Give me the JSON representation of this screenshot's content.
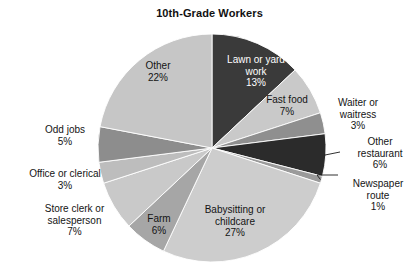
{
  "chart_data": {
    "type": "pie",
    "title": "10th-Grade Workers",
    "xlabel": "",
    "ylabel": "",
    "legend_position": "none",
    "grid": false,
    "units": "percent",
    "start_angle_deg": 0,
    "direction": "clockwise",
    "categories": [
      "Lawn or yard work",
      "Fast food",
      "Waiter or waitress",
      "Other restaurant",
      "Newspaper route",
      "Babysitting or childcare",
      "Farm",
      "Store clerk or salesperson",
      "Office or clerical",
      "Odd jobs",
      "Other"
    ],
    "values": [
      13,
      7,
      3,
      6,
      1,
      27,
      6,
      7,
      3,
      5,
      22
    ],
    "slices": [
      {
        "name": "lawn-or-yard-work",
        "label_line1": "Lawn or yard",
        "label_line2": "work",
        "label_line3": "13%",
        "value": 13,
        "value_text": "13%",
        "color": "#3a3a3a",
        "text_color": "#ffffff",
        "label_placement": "inside",
        "leader_line": false
      },
      {
        "name": "fast-food",
        "label_line1": "Fast food",
        "label_line2": "7%",
        "label_line3": "",
        "value": 7,
        "value_text": "7%",
        "color": "#c9c9c9",
        "text_color": "#141414",
        "label_placement": "inside",
        "leader_line": false
      },
      {
        "name": "waiter-or-waitress",
        "label_line1": "Waiter or",
        "label_line2": "waitress",
        "label_line3": "3%",
        "value": 3,
        "value_text": "3%",
        "color": "#8f8f8f",
        "text_color": "#141414",
        "label_placement": "outside",
        "leader_line": false
      },
      {
        "name": "other-restaurant",
        "label_line1": "Other",
        "label_line2": "restaurant",
        "label_line3": "6%",
        "value": 6,
        "value_text": "6%",
        "color": "#2b2b2b",
        "text_color": "#141414",
        "label_placement": "outside",
        "leader_line": true
      },
      {
        "name": "newspaper-route",
        "label_line1": "Newspaper",
        "label_line2": "route",
        "label_line3": "1%",
        "value": 1,
        "value_text": "1%",
        "color": "#9a9a9a",
        "text_color": "#141414",
        "label_placement": "outside",
        "leader_line": true
      },
      {
        "name": "babysitting-or-childcare",
        "label_line1": "Babysitting or",
        "label_line2": "childcare",
        "label_line3": "27%",
        "value": 27,
        "value_text": "27%",
        "color": "#cdcdcd",
        "text_color": "#141414",
        "label_placement": "inside",
        "leader_line": false
      },
      {
        "name": "farm",
        "label_line1": "Farm",
        "label_line2": "6%",
        "label_line3": "",
        "value": 6,
        "value_text": "6%",
        "color": "#a6a6a6",
        "text_color": "#141414",
        "label_placement": "inside",
        "leader_line": false
      },
      {
        "name": "store-clerk-or-salesperson",
        "label_line1": "Store clerk or",
        "label_line2": "salesperson",
        "label_line3": "7%",
        "value": 7,
        "value_text": "7%",
        "color": "#c9c9c9",
        "text_color": "#141414",
        "label_placement": "outside",
        "leader_line": false
      },
      {
        "name": "office-or-clerical",
        "label_line1": "Office or clerical",
        "label_line2": "3%",
        "label_line3": "",
        "value": 3,
        "value_text": "3%",
        "color": "#bdbdbd",
        "text_color": "#141414",
        "label_placement": "outside",
        "leader_line": false
      },
      {
        "name": "odd-jobs",
        "label_line1": "Odd jobs",
        "label_line2": "5%",
        "label_line3": "",
        "value": 5,
        "value_text": "5%",
        "color": "#8d8d8d",
        "text_color": "#141414",
        "label_placement": "outside",
        "leader_line": false
      },
      {
        "name": "other",
        "label_line1": "Other",
        "label_line2": "22%",
        "label_line3": "",
        "value": 22,
        "value_text": "22%",
        "color": "#c6c6c6",
        "text_color": "#141414",
        "label_placement": "inside",
        "leader_line": false
      }
    ]
  },
  "geometry": {
    "center_x": 212,
    "center_y": 148,
    "radius": 114
  }
}
